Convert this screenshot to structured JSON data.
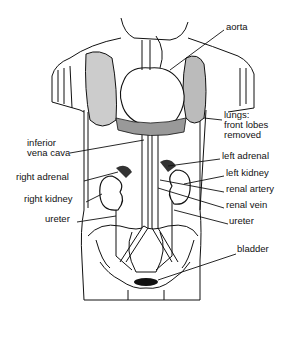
{
  "diagram": {
    "type": "anatomical line drawing",
    "labels": [
      {
        "id": "aorta",
        "text": "aorta",
        "x": 226,
        "y": 27
      },
      {
        "id": "lungs",
        "text": "lungs:",
        "x": 224,
        "y": 115
      },
      {
        "id": "lungs2",
        "text": "front lobes",
        "x": 224,
        "y": 125
      },
      {
        "id": "lungs3",
        "text": "removed",
        "x": 224,
        "y": 135
      },
      {
        "id": "ivc1",
        "text": "inferior",
        "x": 27,
        "y": 143
      },
      {
        "id": "ivc2",
        "text": "vena cava",
        "x": 27,
        "y": 153
      },
      {
        "id": "left_adrenal",
        "text": "left adrenal",
        "x": 222,
        "y": 156
      },
      {
        "id": "right_adrenal",
        "text": "right adrenal",
        "x": 16,
        "y": 177
      },
      {
        "id": "left_kidney",
        "text": "left kidney",
        "x": 226,
        "y": 173
      },
      {
        "id": "renal_artery",
        "text": "renal artery",
        "x": 226,
        "y": 189
      },
      {
        "id": "right_kidney",
        "text": "right kidney",
        "x": 24,
        "y": 199
      },
      {
        "id": "renal_vein",
        "text": "renal vein",
        "x": 226,
        "y": 205
      },
      {
        "id": "ureter_left_side",
        "text": "ureter",
        "x": 45,
        "y": 219
      },
      {
        "id": "ureter_right_side",
        "text": "ureter",
        "x": 229,
        "y": 221
      },
      {
        "id": "bladder",
        "text": "bladder",
        "x": 237,
        "y": 249
      }
    ]
  }
}
